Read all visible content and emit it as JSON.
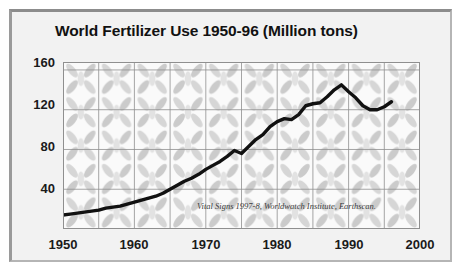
{
  "chart_data": {
    "type": "line",
    "title": "World Fertilizer Use 1950-96 (Million tons)",
    "xlabel": "",
    "ylabel": "",
    "xlim": [
      1950,
      2000
    ],
    "ylim": [
      0,
      168
    ],
    "grid": true,
    "legend": null,
    "annotation": "Vital Signs 1997-8, Worldwatch Institute, Earthscan.",
    "xticks": [
      1950,
      1960,
      1970,
      1980,
      1990,
      2000
    ],
    "yticks": [
      40,
      80,
      120,
      160
    ],
    "line_color": "#111111",
    "background_color": "#f2f2f2",
    "series": [
      {
        "name": "World Fertilizer Use",
        "x": [
          1950,
          1951,
          1952,
          1953,
          1954,
          1955,
          1956,
          1957,
          1958,
          1959,
          1960,
          1961,
          1962,
          1963,
          1964,
          1965,
          1966,
          1967,
          1968,
          1969,
          1970,
          1971,
          1972,
          1973,
          1974,
          1975,
          1976,
          1977,
          1978,
          1979,
          1980,
          1981,
          1982,
          1983,
          1984,
          1985,
          1986,
          1987,
          1988,
          1989,
          1990,
          1991,
          1992,
          1993,
          1994,
          1995,
          1996
        ],
        "values": [
          14,
          15,
          16,
          17,
          18,
          19,
          21,
          22,
          23,
          25,
          27,
          29,
          31,
          33,
          36,
          40,
          44,
          48,
          51,
          55,
          60,
          64,
          68,
          73,
          79,
          76,
          83,
          90,
          95,
          103,
          108,
          111,
          110,
          115,
          124,
          126,
          127,
          133,
          140,
          145,
          138,
          132,
          124,
          120,
          120,
          123,
          128
        ]
      }
    ]
  },
  "figure": {
    "title": "World Fertilizer Use 1950-96 (Million tons)",
    "source": "Vital Signs 1997-8, Worldwatch Institute, Earthscan."
  }
}
